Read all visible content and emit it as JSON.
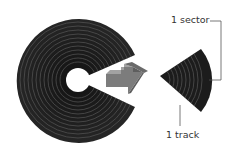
{
  "diagram": {
    "labels": {
      "sector": "1 sector",
      "track": "1 track"
    },
    "colors": {
      "disk": "#1c1c1c",
      "track_line": "#5a5a5a",
      "arrow_front": "#7a7a7a",
      "arrow_top": "#a0a0a0",
      "arrow_side": "#5e5e5e",
      "leader_line": "#444444",
      "text": "#333333"
    },
    "elements": [
      {
        "id": "disk",
        "type": "disk-with-wedge-removed",
        "track_count": 11
      },
      {
        "id": "arrow",
        "type": "3d-arrow",
        "direction": "right"
      },
      {
        "id": "sector-wedge",
        "type": "extracted-sector"
      }
    ]
  }
}
